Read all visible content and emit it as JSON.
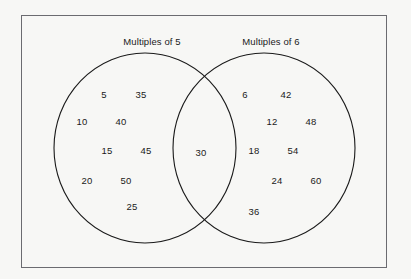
{
  "figure": {
    "type": "venn-diagram",
    "sets": [
      {
        "id": "left",
        "label": "Multiples of 5"
      },
      {
        "id": "right",
        "label": "Multiples of 6"
      }
    ],
    "colors": {
      "background": "#f7f7f5",
      "rectangle_border": "#6b6b70",
      "circle_stroke": "#1a1a1a",
      "text": "#1a1a1a"
    }
  },
  "regions": {
    "left_only": {
      "name": "Multiples of 5 only",
      "members": [
        {
          "value": "5",
          "x": 104,
          "y": 94
        },
        {
          "value": "35",
          "x": 141,
          "y": 94
        },
        {
          "value": "10",
          "x": 82,
          "y": 121
        },
        {
          "value": "40",
          "x": 121,
          "y": 121
        },
        {
          "value": "15",
          "x": 107,
          "y": 150
        },
        {
          "value": "45",
          "x": 146,
          "y": 150
        },
        {
          "value": "20",
          "x": 87,
          "y": 180
        },
        {
          "value": "50",
          "x": 126,
          "y": 180
        },
        {
          "value": "25",
          "x": 132,
          "y": 206
        }
      ]
    },
    "intersection": {
      "name": "Multiples of 5 and 6",
      "members": [
        {
          "value": "30",
          "x": 201,
          "y": 152
        }
      ]
    },
    "right_only": {
      "name": "Multiples of 6 only",
      "members": [
        {
          "value": "6",
          "x": 245,
          "y": 94
        },
        {
          "value": "42",
          "x": 286,
          "y": 94
        },
        {
          "value": "12",
          "x": 272,
          "y": 121
        },
        {
          "value": "48",
          "x": 311,
          "y": 121
        },
        {
          "value": "18",
          "x": 254,
          "y": 150
        },
        {
          "value": "54",
          "x": 293,
          "y": 150
        },
        {
          "value": "24",
          "x": 277,
          "y": 180
        },
        {
          "value": "60",
          "x": 316,
          "y": 180
        },
        {
          "value": "36",
          "x": 254,
          "y": 211
        }
      ]
    }
  },
  "geometry": {
    "rectangle": {
      "x": 21,
      "y": 15,
      "width": 366,
      "height": 253
    },
    "left_circle": {
      "cx": 145,
      "cy": 148,
      "rx": 91,
      "ry": 95
    },
    "right_circle": {
      "cx": 264,
      "cy": 148,
      "rx": 91,
      "ry": 95
    }
  }
}
